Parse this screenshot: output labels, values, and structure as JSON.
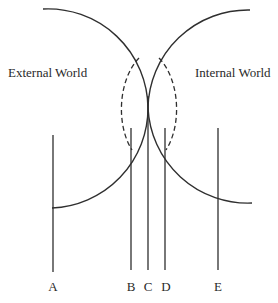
{
  "diagram": {
    "type": "two tangent semicircles with dashed inner arcs and vertical reference lines",
    "regions": {
      "left_label": "External World",
      "right_label": "Internal World"
    },
    "lines": [
      {
        "id": "A",
        "label": "A"
      },
      {
        "id": "B",
        "label": "B"
      },
      {
        "id": "C",
        "label": "C"
      },
      {
        "id": "D",
        "label": "D"
      },
      {
        "id": "E",
        "label": "E"
      }
    ],
    "colors": {
      "stroke": "#2f2f2f",
      "text": "#2a2a2a",
      "background": "#ffffff"
    }
  }
}
